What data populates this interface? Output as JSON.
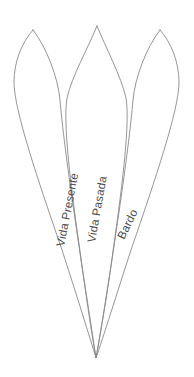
{
  "diagram": {
    "background_color": "#ffffff",
    "stroke_color": "#8a8a8a",
    "label_color": "#4a4a4a",
    "convergence_point": {
      "x": 96,
      "y": 358
    },
    "petals": [
      {
        "id": "petal-left",
        "label": "Vida Presente",
        "tip": {
          "x": 33,
          "y": 30
        },
        "label_x": 64,
        "label_y": 247,
        "label_rotation": -79
      },
      {
        "id": "petal-middle",
        "label": "Vida Pasada",
        "tip": {
          "x": 97,
          "y": 26
        },
        "label_x": 95,
        "label_y": 243,
        "label_rotation": -80
      },
      {
        "id": "petal-right",
        "label": "Bardo",
        "tip": {
          "x": 160,
          "y": 30
        },
        "label_x": 124,
        "label_y": 240,
        "label_rotation": -64
      }
    ]
  }
}
